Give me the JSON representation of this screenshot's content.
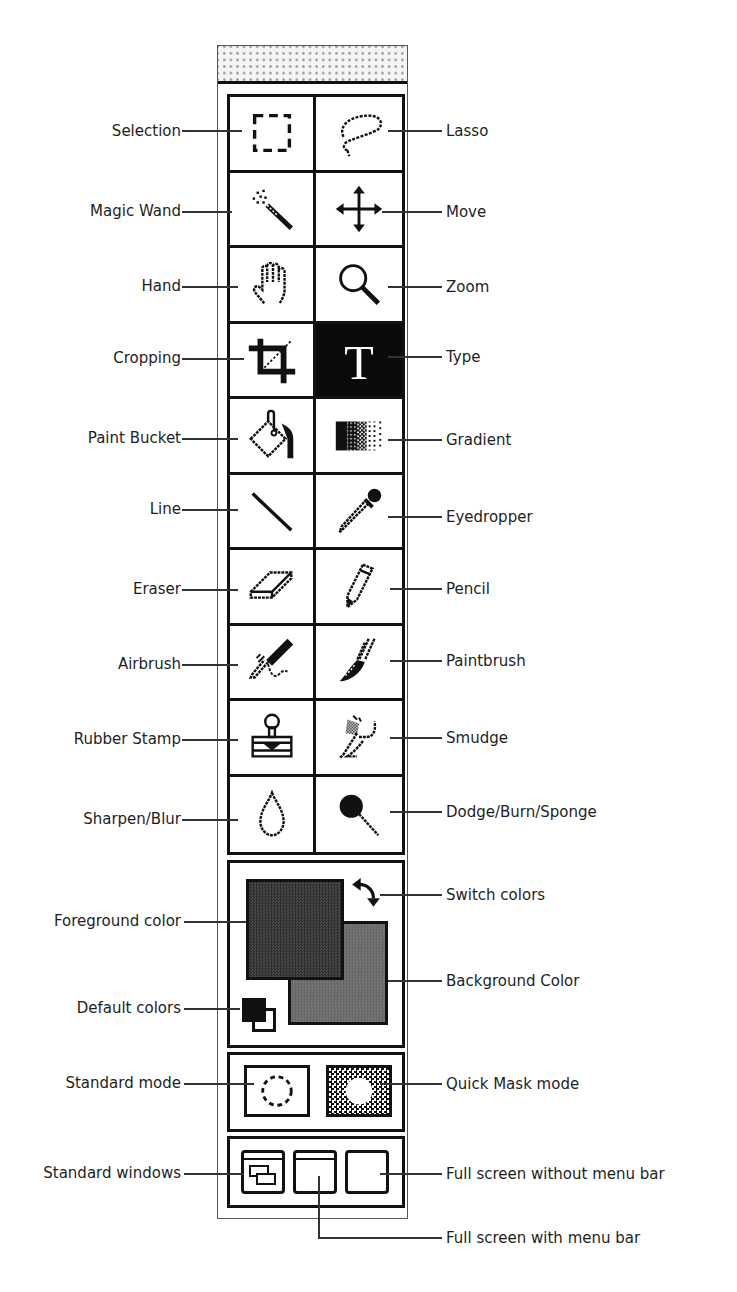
{
  "palette": {
    "tools": [
      {
        "name": "Selection",
        "icon": "marquee-icon",
        "side": "left",
        "active": false
      },
      {
        "name": "Lasso",
        "icon": "lasso-icon",
        "side": "right",
        "active": false
      },
      {
        "name": "Magic Wand",
        "icon": "magic-wand-icon",
        "side": "left",
        "active": false
      },
      {
        "name": "Move",
        "icon": "move-icon",
        "side": "right",
        "active": false
      },
      {
        "name": "Hand",
        "icon": "hand-icon",
        "side": "left",
        "active": false
      },
      {
        "name": "Zoom",
        "icon": "zoom-icon",
        "side": "right",
        "active": false
      },
      {
        "name": "Cropping",
        "icon": "crop-icon",
        "side": "left",
        "active": false
      },
      {
        "name": "Type",
        "icon": "type-icon",
        "side": "right",
        "active": true
      },
      {
        "name": "Paint Bucket",
        "icon": "paint-bucket-icon",
        "side": "left",
        "active": false
      },
      {
        "name": "Gradient",
        "icon": "gradient-icon",
        "side": "right",
        "active": false
      },
      {
        "name": "Line",
        "icon": "line-icon",
        "side": "left",
        "active": false
      },
      {
        "name": "Eyedropper",
        "icon": "eyedropper-icon",
        "side": "right",
        "active": false
      },
      {
        "name": "Eraser",
        "icon": "eraser-icon",
        "side": "left",
        "active": false
      },
      {
        "name": "Pencil",
        "icon": "pencil-icon",
        "side": "right",
        "active": false
      },
      {
        "name": "Airbrush",
        "icon": "airbrush-icon",
        "side": "left",
        "active": false
      },
      {
        "name": "Paintbrush",
        "icon": "paintbrush-icon",
        "side": "right",
        "active": false
      },
      {
        "name": "Rubber Stamp",
        "icon": "rubber-stamp-icon",
        "side": "left",
        "active": false
      },
      {
        "name": "Smudge",
        "icon": "smudge-icon",
        "side": "right",
        "active": false
      },
      {
        "name": "Sharpen/Blur",
        "icon": "sharpen-blur-icon",
        "side": "left",
        "active": false
      },
      {
        "name": "Dodge/Burn/Sponge",
        "icon": "dodge-burn-sponge-icon",
        "side": "right",
        "active": false
      }
    ],
    "colors": {
      "foreground_label": "Foreground color",
      "background_label": "Background Color",
      "switch_label": "Switch colors",
      "default_label": "Default colors",
      "foreground_hex": "#3a3a3a",
      "background_hex": "#6e6e6e"
    },
    "modes": {
      "standard_label": "Standard mode",
      "quickmask_label": "Quick Mask mode"
    },
    "screens": {
      "standard_label": "Standard windows",
      "fullmenu_label": "Full screen with menu bar",
      "fullnomenu_label": "Full screen without menu bar"
    }
  }
}
